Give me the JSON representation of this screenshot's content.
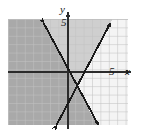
{
  "figure": {
    "kind": "coordinate-plane-graph",
    "background_color": "#ffffff"
  },
  "labels": {
    "y_axis": "y",
    "y_tick": "5",
    "x_axis": "x",
    "x_tick": "5"
  },
  "colors": {
    "grid_fill": "#d8d8d8",
    "grid_line": "#c2c2c2",
    "shade_dark": "#a9a9a9",
    "shade_light": "#cfcfcf",
    "unshaded": "#ffffff",
    "axis": "#2b2b2b",
    "line": "#1a1a1a"
  },
  "chart_data": {
    "type": "line",
    "title": "",
    "xlabel": "x",
    "ylabel": "y",
    "xlim": [
      -7.1,
      7.1
    ],
    "ylim": [
      -6.3,
      6.3
    ],
    "grid": true,
    "grid_step": 1,
    "legend": "none",
    "origin_px": [
      68,
      72
    ],
    "unit_px": 8.4,
    "plot_box_px": {
      "left": 8,
      "top": 19,
      "right": 128,
      "bottom": 125
    },
    "x_ticks": [
      5
    ],
    "y_ticks": [
      5
    ],
    "series": [
      {
        "name": "boundary-line-negative-slope",
        "style": "solid",
        "arrowheads": "both",
        "points_px": [
          [
            42,
            20
          ],
          [
            100,
            128
          ]
        ],
        "points_units": [
          [
            -3.1,
            6.2
          ],
          [
            3.8,
            -6.7
          ]
        ],
        "slope": -1.86,
        "intercept": 0.45
      },
      {
        "name": "boundary-line-positive-slope",
        "style": "solid",
        "arrowheads": "both",
        "points_px": [
          [
            55,
            128
          ],
          [
            112,
            20
          ]
        ],
        "points_units": [
          [
            -1.55,
            -6.7
          ],
          [
            5.2,
            6.2
          ]
        ],
        "slope": 1.9,
        "intercept": -3.6
      }
    ],
    "shaded_regions": [
      {
        "name": "dark-region-left",
        "color": "#a9a9a9",
        "description": "region left of the negative-slope line"
      },
      {
        "name": "light-region-wedge",
        "color": "#cfcfcf",
        "description": "wedge between the two lines, left of positive-slope line"
      },
      {
        "name": "unshaded-region-right",
        "color": "#ffffff",
        "description": "region right of the positive-slope line"
      }
    ]
  }
}
